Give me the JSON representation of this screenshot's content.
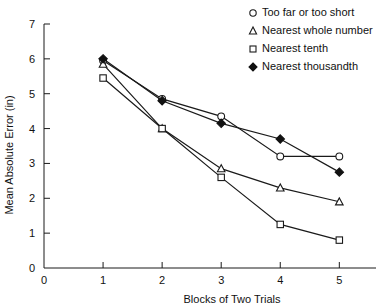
{
  "chart_data": {
    "type": "line",
    "title": "",
    "xlabel": "Blocks of Two Trials",
    "ylabel": "Mean Absolute Error (in)",
    "x": [
      1,
      2,
      3,
      4,
      5
    ],
    "xlim": [
      0,
      5.35
    ],
    "ylim": [
      0,
      7
    ],
    "xticks": [
      0,
      1,
      2,
      3,
      4,
      5
    ],
    "xticklabels": [
      "0",
      "1",
      "2",
      "3",
      "4",
      "5"
    ],
    "yticks": [
      0,
      1,
      2,
      3,
      4,
      5,
      6,
      7
    ],
    "yticklabels": [
      "0",
      "1",
      "2",
      "3",
      "4",
      "5",
      "6",
      "7"
    ],
    "grid": false,
    "legend_position": "top-right",
    "series": [
      {
        "name": "Too far or too short",
        "marker": "open-circle",
        "values": [
          5.95,
          4.85,
          4.35,
          3.2,
          3.2
        ]
      },
      {
        "name": "Nearest whole number",
        "marker": "open-triangle",
        "values": [
          5.85,
          4.0,
          2.85,
          2.3,
          1.9
        ]
      },
      {
        "name": "Nearest tenth",
        "marker": "open-square",
        "values": [
          5.45,
          4.0,
          2.6,
          1.25,
          0.8
        ]
      },
      {
        "name": "Nearest thousandth",
        "marker": "filled-diamond",
        "values": [
          6.0,
          4.8,
          4.15,
          3.7,
          2.75
        ]
      }
    ]
  },
  "legend": {
    "items": [
      {
        "label": "Too far or too short",
        "marker": "open-circle"
      },
      {
        "label": "Nearest whole number",
        "marker": "open-triangle"
      },
      {
        "label": "Nearest tenth",
        "marker": "open-square"
      },
      {
        "label": "Nearest thousandth",
        "marker": "filled-diamond"
      }
    ]
  }
}
